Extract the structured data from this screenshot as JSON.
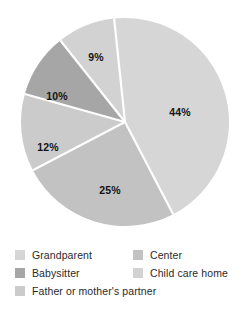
{
  "chart_data": {
    "type": "pie",
    "title": "",
    "subtitle": "",
    "xlabel": "",
    "ylabel": "",
    "grid": false,
    "legend_position": "bottom",
    "legend_columns": 2,
    "total": 100,
    "units": "%",
    "start_angle_deg": -6,
    "direction": "clockwise",
    "categories": [
      "Grandparent",
      "Center",
      "Child care home",
      "Babysitter",
      "Father or mother's partner"
    ],
    "values": [
      44,
      25,
      12,
      10,
      9
    ],
    "slices": [
      {
        "label": "44%",
        "value": 44,
        "category": "Grandparent",
        "color": "#d6d6d6",
        "label_x": 180,
        "label_y": 112
      },
      {
        "label": "25%",
        "value": 25,
        "category": "Center",
        "color": "#c2c2c2",
        "label_x": 110,
        "label_y": 190
      },
      {
        "label": "12%",
        "value": 12,
        "category": "Father or mother's partner",
        "color": "#cbcbcb",
        "label_x": 48,
        "label_y": 147
      },
      {
        "label": "10%",
        "value": 10,
        "category": "Babysitter",
        "color": "#a6a6a6",
        "label_x": 57,
        "label_y": 96
      },
      {
        "label": "9%",
        "value": 9,
        "category": "Child care home",
        "color": "#d2d2d2",
        "label_x": 96,
        "label_y": 57
      }
    ],
    "separator_color": "#ffffff",
    "background": "#ffffff"
  },
  "legend": {
    "left_column": [
      {
        "label": "Grandparent",
        "color": "#d6d6d6"
      },
      {
        "label": "Babysitter",
        "color": "#a6a6a6"
      },
      {
        "label": "Father or mother's partner",
        "color": "#cbcbcb"
      }
    ],
    "right_column": [
      {
        "label": "Center",
        "color": "#c2c2c2"
      },
      {
        "label": "Child care home",
        "color": "#d2d2d2"
      }
    ]
  }
}
